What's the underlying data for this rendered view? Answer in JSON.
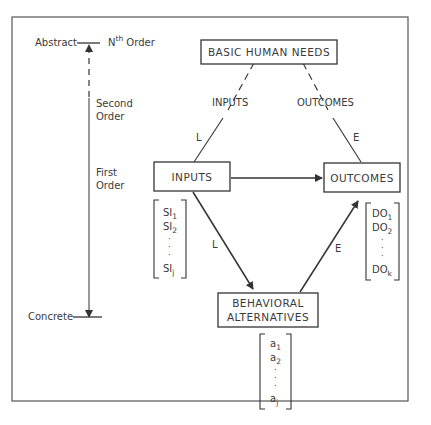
{
  "scale": {
    "top_label": "Abstract",
    "top_order_base": "N",
    "top_order_sup": "th",
    "top_order_suffix": " Order",
    "second_order_1": "Second",
    "second_order_2": "Order",
    "first_order_1": "First",
    "first_order_2": "Order",
    "bottom_label": "Concrete"
  },
  "boxes": {
    "basic_needs": "BASIC HUMAN NEEDS",
    "inputs": "INPUTS",
    "outcomes": "OUTCOMES",
    "behavioral_1": "BEHAVIORAL",
    "behavioral_2": "ALTERNATIVES"
  },
  "edge_labels": {
    "inputs_dashed": "INPUTS",
    "outcomes_dashed": "OUTCOMES",
    "l_upper": "L",
    "e_upper": "E",
    "l_lower": "L",
    "e_lower": "E"
  },
  "vectors": {
    "si": {
      "base": "SI",
      "items": [
        "1",
        "2",
        "j"
      ]
    },
    "do": {
      "base": "DO",
      "items": [
        "1",
        "2",
        "k"
      ]
    },
    "a": {
      "base": "a",
      "items": [
        "1",
        "2",
        "j"
      ]
    }
  }
}
